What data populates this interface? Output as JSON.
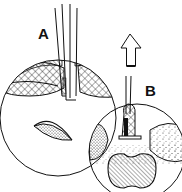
{
  "figure": {
    "type": "technical line-art illustration",
    "style": "black ink on white",
    "colors": {
      "ink": "#111111",
      "background": "#ffffff"
    },
    "panels": [
      {
        "id": "A",
        "label": "A",
        "description": "Circular magnified inset with a vertical tubular instrument entering tissue layers (crosshatched)"
      },
      {
        "id": "B",
        "label": "B",
        "description": "Circular magnified inset with thin instrument tip, hatched/stippled tissue and bilobed hatched structure; hollow arrow pointing upward indicates withdrawal"
      }
    ],
    "arrow": {
      "direction": "up",
      "style": "hollow outline"
    }
  }
}
